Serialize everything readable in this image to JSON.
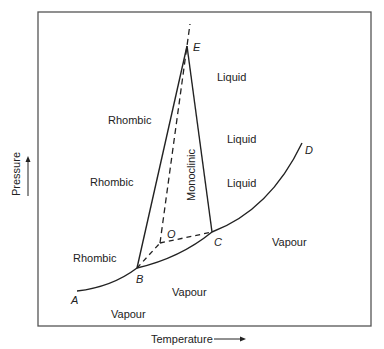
{
  "diagram": {
    "axes": {
      "xlabel": "Temperature",
      "ylabel": "Pressure"
    },
    "points": {
      "A": "A",
      "B": "B",
      "C": "C",
      "D": "D",
      "E": "E",
      "O": "O"
    },
    "regions": {
      "rhombic_1": "Rhombic",
      "rhombic_2": "Rhombic",
      "rhombic_3": "Rhombic",
      "monoclinic": "Monoclinic",
      "liquid_1": "Liquid",
      "liquid_2": "Liquid",
      "liquid_3": "Liquid",
      "vapour_1": "Vapour",
      "vapour_2": "Vapour",
      "vapour_3": "Vapour"
    },
    "colors": {
      "line": "#222222",
      "frame": "#444444"
    }
  }
}
